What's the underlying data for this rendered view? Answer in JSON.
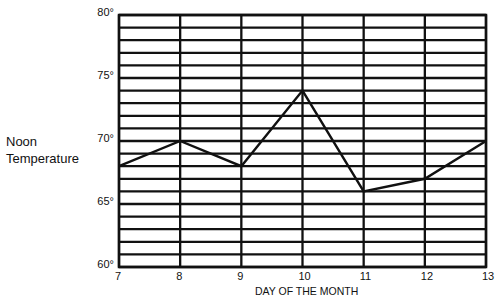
{
  "chart_data": {
    "type": "line",
    "title": "",
    "xlabel": "DAY OF THE MONTH",
    "ylabel": "Noon Temperature",
    "x": [
      7,
      8,
      9,
      10,
      11,
      12,
      13
    ],
    "categories": [
      "7",
      "8",
      "9",
      "10",
      "11",
      "12",
      "13"
    ],
    "series": [
      {
        "name": "Noon Temperature",
        "values": [
          68,
          70,
          68,
          74,
          66,
          67,
          70
        ]
      }
    ],
    "ylim": [
      60,
      80
    ],
    "yticks": [
      60,
      65,
      70,
      75,
      80
    ],
    "ytick_labels": [
      "60°",
      "65°",
      "70°",
      "75°",
      "80°"
    ],
    "grid": true,
    "grid_minor_step": 1,
    "legend": null
  },
  "layout": {
    "plot": {
      "left": 119,
      "right": 486,
      "top": 15,
      "bottom": 267
    },
    "colors": {
      "line": "#111111",
      "grid": "#111111",
      "background": "#ffffff"
    }
  }
}
